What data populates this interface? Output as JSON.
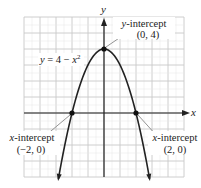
{
  "chart_data": {
    "type": "line",
    "title": "",
    "equation": "y = 4 − x²",
    "function": "4 - x^2",
    "xlabel": "x",
    "ylabel": "y",
    "xlim": [
      -5,
      5
    ],
    "ylim": [
      -4,
      6
    ],
    "grid": true,
    "grid_step": 1,
    "points": [
      {
        "name": "y-intercept",
        "label": "y-intercept",
        "coords": "(0, 4)",
        "x": 0,
        "y": 4
      },
      {
        "name": "x-intercept-left",
        "label": "x-intercept",
        "coords": "(−2, 0)",
        "x": -2,
        "y": 0
      },
      {
        "name": "x-intercept-right",
        "label": "x-intercept",
        "coords": "(2, 0)",
        "x": 2,
        "y": 0
      }
    ],
    "series": [
      {
        "name": "y = 4 − x²",
        "x": [
          -2.85,
          -2,
          -1,
          0,
          1,
          2,
          2.85
        ],
        "y": [
          -4.1,
          0,
          3,
          4,
          3,
          0,
          -4.1
        ]
      }
    ]
  },
  "labels": {
    "x_axis": "x",
    "y_axis": "y",
    "equation": "y = 4 − x",
    "equation_exp": "2",
    "yint_title": "y-intercept",
    "yint_coords": "(0, 4)",
    "xint_left_title": "x-intercept",
    "xint_left_coords": "(−2, 0)",
    "xint_right_title": "x-intercept",
    "xint_right_coords": "(2, 0)"
  },
  "colors": {
    "grid": "#c8c8c8",
    "axis": "#222222",
    "curve": "#222222",
    "leader": "#888888"
  }
}
